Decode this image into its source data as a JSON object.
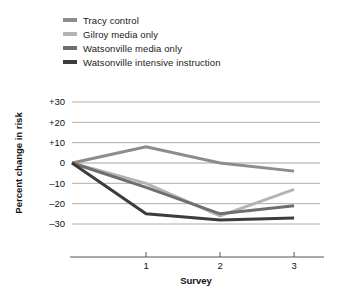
{
  "chart_data": {
    "type": "line",
    "title": "",
    "xlabel": "Survey",
    "ylabel": "Percent change in risk",
    "x": [
      0,
      1,
      2,
      3
    ],
    "xtick_labels": [
      "1",
      "2",
      "3"
    ],
    "xtick_values": [
      1,
      2,
      3
    ],
    "xlim": [
      0,
      3.35
    ],
    "ylim": [
      -35,
      33
    ],
    "ytick_labels": [
      "+30",
      "+20",
      "+10",
      "0",
      "–10",
      "–20",
      "–30"
    ],
    "ytick_values": [
      30,
      20,
      10,
      0,
      -10,
      -20,
      -30
    ],
    "grid": true,
    "grid_axis": "y",
    "legend_position": "top-left",
    "series": [
      {
        "name": "Tracy control",
        "color": "#8c8c8c",
        "values": [
          0,
          8,
          0,
          -4
        ]
      },
      {
        "name": "Gilroy media only",
        "color": "#b4b4b4",
        "values": [
          0,
          -10,
          -26,
          -13
        ]
      },
      {
        "name": "Watsonville media only",
        "color": "#6e6e6e",
        "values": [
          0,
          -12,
          -25,
          -21
        ]
      },
      {
        "name": "Watsonville intensive instruction",
        "color": "#3c3c3c",
        "values": [
          0,
          -25,
          -28,
          -27
        ]
      }
    ]
  },
  "legend": {
    "items": [
      {
        "label": "Tracy control",
        "color": "#8c8c8c"
      },
      {
        "label": "Gilroy media only",
        "color": "#b4b4b4"
      },
      {
        "label": "Watsonville media only",
        "color": "#6e6e6e"
      },
      {
        "label": "Watsonville intensive instruction",
        "color": "#3c3c3c"
      }
    ]
  },
  "axes": {
    "y_title": "Percent change in risk",
    "x_title": "Survey",
    "y_ticks": [
      "+30",
      "+20",
      "+10",
      "0",
      "–10",
      "–20",
      "–30"
    ],
    "x_ticks": [
      "1",
      "2",
      "3"
    ]
  },
  "colors": {
    "grid": "#999999",
    "axis": "#555555",
    "text": "#111111",
    "background": "#ffffff"
  }
}
